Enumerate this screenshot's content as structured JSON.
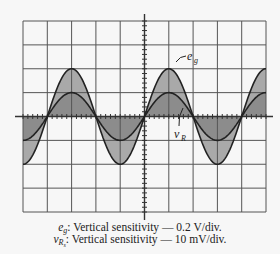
{
  "figure": {
    "type": "oscilloscope-display",
    "grid": {
      "horizontal_divisions": 10,
      "vertical_divisions": 8
    },
    "traces": [
      {
        "name": "e_g",
        "label_main": "e",
        "label_sub": "g",
        "amplitude_div": 2,
        "period_div": 4,
        "fill": "#a9a9a9"
      },
      {
        "name": "v_R",
        "label_main": "v",
        "label_sub": "R",
        "amplitude_div": 1,
        "period_div": 4,
        "fill": "#8c8c8c"
      }
    ],
    "captions": [
      {
        "sym": "e",
        "sub": "g",
        "text": ": Vertical sensitivity  —  0.2 V/div."
      },
      {
        "sym": "v",
        "sub": "R",
        "subsub": "s",
        "text": ": Vertical sensitivity  —  10 mV/div."
      }
    ]
  },
  "labels": {
    "eg_main": "e",
    "eg_sub": "g",
    "vr_main": "v",
    "vr_sub": "R"
  }
}
